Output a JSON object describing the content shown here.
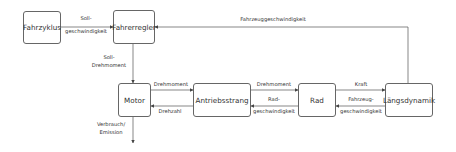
{
  "blocks": {
    "fahrzyklus": "Fahrzyklus",
    "fahrerregler": "Fahrerregler",
    "motor": "Motor",
    "antriebsstrang": "Antriebsstrang",
    "rad": "Rad",
    "laengsdynamik": "Längsdynamik"
  },
  "signals": {
    "soll_geschwindigkeit_1": "Soll-",
    "soll_geschwindigkeit_2": "geschwindigkeit",
    "fahrzeuggeschwindigkeit_feedback": "Fahrzeuggeschwindigkeit",
    "soll_drehmoment_1": "Soll-",
    "soll_drehmoment_2": "Drehmoment",
    "drehmoment_motor": "Drehmoment",
    "drehzahl": "Drehzahl",
    "drehmoment_antrieb": "Drehmoment",
    "radgeschwindigkeit_1": "Rad-",
    "radgeschwindigkeit_2": "geschwindigkeit",
    "kraft": "Kraft",
    "fahrzeuggeschwindigkeit_1": "Fahrzeug-",
    "fahrzeuggeschwindigkeit_2": "geschwindigkeit",
    "verbrauch_1": "Verbrauch/",
    "verbrauch_2": "Emission"
  },
  "colors": {
    "line": "#555555",
    "border": "#666666",
    "text": "#333333"
  }
}
